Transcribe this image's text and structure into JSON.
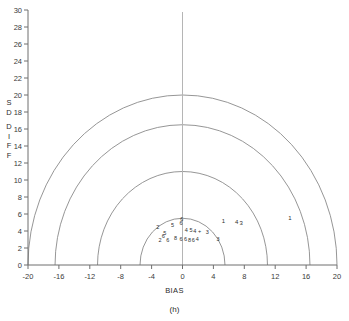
{
  "figure": {
    "caption": "(h)",
    "background": "#ffffff",
    "axis_color": "#6f6f6f",
    "arc_color": "#8a8a8a",
    "marker_color": "#2f2f2f"
  },
  "chart_data": {
    "type": "scatter",
    "title": "",
    "subtitle": "",
    "caption": "(h)",
    "xlabel": "BIAS",
    "ylabel": "SD DIFF",
    "xlim": [
      -20,
      20
    ],
    "ylim": [
      0,
      30
    ],
    "xticks": [
      -20,
      -16,
      -12,
      -8,
      -4,
      0,
      4,
      8,
      12,
      16,
      20
    ],
    "xticklabels": [
      "-20",
      "-16",
      "-12",
      "-8",
      "-4",
      "0",
      "4",
      "8",
      "12",
      "16",
      "20"
    ],
    "yticks": [
      0,
      2,
      4,
      6,
      8,
      10,
      12,
      14,
      16,
      18,
      20,
      22,
      24,
      26,
      28,
      30
    ],
    "yticklabels": [
      "0",
      "2",
      "4",
      "6",
      "8",
      "10",
      "12",
      "14",
      "16",
      "18",
      "20",
      "22",
      "24",
      "26",
      "28",
      "30"
    ],
    "ytick_minor_step": 2,
    "grid": false,
    "legend": null,
    "legend_position": "none",
    "annotations": [
      "Semicircular reference arcs of constant total error (RMS) centred on the origin",
      "Point markers are labelled by model/station number"
    ],
    "reference_arcs": {
      "type": "semicircle",
      "center": [
        0,
        0
      ],
      "radii": [
        5.5,
        11.0,
        16.5,
        20.0
      ],
      "description": "constant RMS difference contours"
    },
    "axis_lines": {
      "vertical_at_x": 0,
      "horizontal_at_y": 0
    },
    "series": [
      {
        "name": "stations",
        "marker": "digit-label",
        "points": [
          {
            "label": "2",
            "x": -3.2,
            "y": 4.5
          },
          {
            "label": "5",
            "x": -1.3,
            "y": 4.7
          },
          {
            "label": "6",
            "x": -0.1,
            "y": 5.4
          },
          {
            "label": "6",
            "x": -0.2,
            "y": 4.9
          },
          {
            "label": "5",
            "x": -2.3,
            "y": 3.8
          },
          {
            "label": "6",
            "x": -2.5,
            "y": 3.4
          },
          {
            "label": "2",
            "x": -2.9,
            "y": 3.0
          },
          {
            "label": "6",
            "x": -1.9,
            "y": 2.9
          },
          {
            "label": "8",
            "x": -0.9,
            "y": 3.2
          },
          {
            "label": "6",
            "x": -0.2,
            "y": 3.1
          },
          {
            "label": "6",
            "x": 0.4,
            "y": 3.1
          },
          {
            "label": "8",
            "x": 0.9,
            "y": 3.0
          },
          {
            "label": "6",
            "x": 1.4,
            "y": 3.0
          },
          {
            "label": "4",
            "x": 1.9,
            "y": 3.1
          },
          {
            "label": "4",
            "x": 0.5,
            "y": 4.1
          },
          {
            "label": "5",
            "x": 1.1,
            "y": 4.1
          },
          {
            "label": "4",
            "x": 1.6,
            "y": 4.0
          },
          {
            "label": "+",
            "x": 2.2,
            "y": 4.0
          },
          {
            "label": "3",
            "x": 3.2,
            "y": 3.9
          },
          {
            "label": "3",
            "x": 4.6,
            "y": 3.1
          },
          {
            "label": "1",
            "x": 5.3,
            "y": 5.2
          },
          {
            "label": "4",
            "x": 7.0,
            "y": 5.1
          },
          {
            "label": "3",
            "x": 7.6,
            "y": 5.0
          },
          {
            "label": "1",
            "x": 13.9,
            "y": 5.5
          }
        ]
      }
    ]
  },
  "geometry": {
    "px_left": 28,
    "px_right": 337,
    "px_bottom": 265,
    "px_top": 10,
    "note": "pixel anchors used by the template to map data coordinates"
  }
}
